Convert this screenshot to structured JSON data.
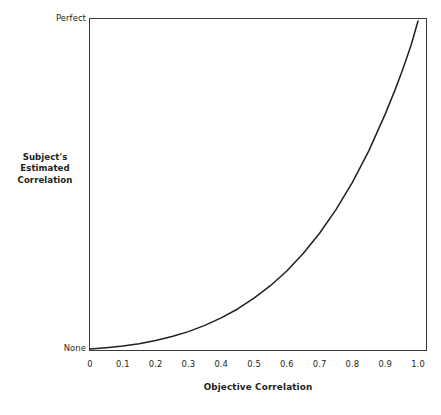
{
  "chart_data": {
    "type": "line",
    "title": "",
    "xlabel": "Objective Correlation",
    "ylabel": "Subject's Estimated Correlation",
    "ylabel_lines": [
      "Subject's",
      "Estimated",
      "Correlation"
    ],
    "xlim": [
      0,
      1.0
    ],
    "ylim": [
      0,
      1.0
    ],
    "grid": false,
    "legend": "none",
    "x_tick_labels": [
      "0",
      "0.1",
      "0.2",
      "0.3",
      "0.4",
      "0.5",
      "0.6",
      "0.7",
      "0.8",
      "0.9",
      "1.0"
    ],
    "x_tick_values": [
      0,
      0.1,
      0.2,
      0.3,
      0.4,
      0.5,
      0.6,
      0.7,
      0.8,
      0.9,
      1.0
    ],
    "y_tick_labels": [
      "None",
      "Perfect"
    ],
    "y_tick_values": [
      0,
      1.0
    ],
    "y_axis_min_label": "None",
    "y_axis_max_label": "Perfect",
    "series": [
      {
        "name": "Subjective estimate of correlation",
        "x": [
          0.0,
          0.05,
          0.1,
          0.15,
          0.2,
          0.25,
          0.3,
          0.35,
          0.4,
          0.45,
          0.5,
          0.55,
          0.6,
          0.65,
          0.7,
          0.75,
          0.8,
          0.85,
          0.9,
          0.93,
          0.95,
          0.97,
          0.98,
          0.99,
          1.0
        ],
        "y": [
          0.0,
          0.004,
          0.009,
          0.016,
          0.026,
          0.038,
          0.053,
          0.072,
          0.095,
          0.122,
          0.155,
          0.193,
          0.238,
          0.291,
          0.353,
          0.425,
          0.508,
          0.604,
          0.716,
          0.79,
          0.843,
          0.9,
          0.93,
          0.965,
          1.0
        ]
      }
    ],
    "line_color": "#231f20",
    "frame_color": "#3a3a3c",
    "background_color": "#ffffff"
  },
  "axes": {
    "y_top_label": "Perfect",
    "y_bottom_label": "None",
    "y_title_line1": "Subject's",
    "y_title_line2": "Estimated",
    "y_title_line3": "Correlation",
    "x_title": "Objective Correlation",
    "x_tick_0": "0",
    "x_tick_1": "0.1",
    "x_tick_2": "0.2",
    "x_tick_3": "0.3",
    "x_tick_4": "0.4",
    "x_tick_5": "0.5",
    "x_tick_6": "0.6",
    "x_tick_7": "0.7",
    "x_tick_8": "0.8",
    "x_tick_9": "0.9",
    "x_tick_10": "1.0"
  }
}
